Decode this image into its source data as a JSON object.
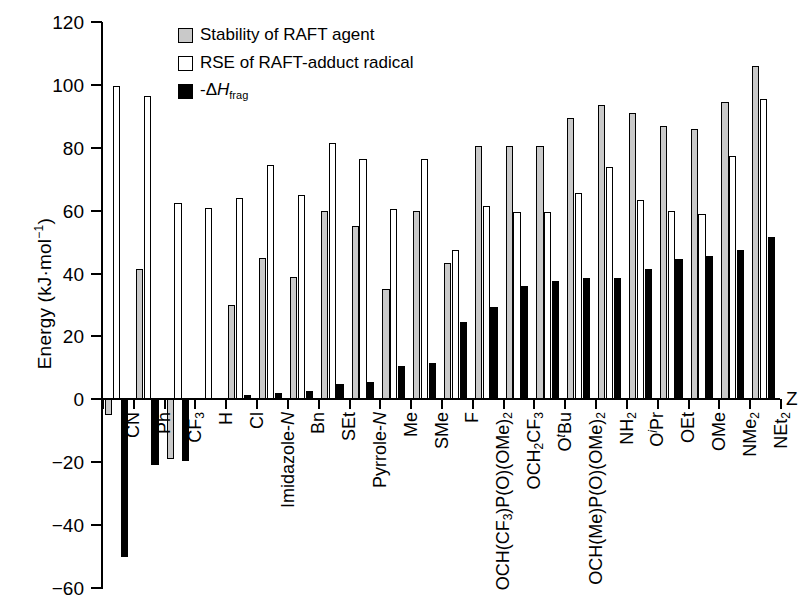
{
  "chart_data": {
    "type": "bar",
    "title": "",
    "xlabel": "Z",
    "ylabel": "Energy (kJ·mol⁻¹)",
    "ylim": [
      -60,
      120
    ],
    "yticks": [
      120,
      100,
      80,
      60,
      40,
      20,
      0,
      -20,
      -40,
      -60
    ],
    "grid": false,
    "legend_position": "top-left-inside",
    "categories": [
      "CN",
      "Ph",
      "CF3",
      "H",
      "Cl",
      "Imidazole-N",
      "Bn",
      "SEt",
      "Pyrrole-N",
      "Me",
      "SMe",
      "F",
      "OCH(CF3)P(O)(OMe)2",
      "OCH2CF3",
      "OtBu",
      "OCH(Me)P(O)(OMe)2",
      "NH2",
      "OiPr",
      "OEt",
      "OMe",
      "NMe2",
      "NEt2"
    ],
    "category_labels_html": [
      "CN",
      "Ph",
      "CF<sub>3</sub>",
      "H",
      "Cl",
      "Imidazole-<i>N</i>",
      "Bn",
      "SEt",
      "Pyrrole-<i>N</i>",
      "Me",
      "SMe",
      "F",
      "OCH(CF<sub>3</sub>)P(O)(OMe)<sub>2</sub>",
      "OCH<sub>2</sub>CF<sub>3</sub>",
      "O<sup>t</sup>Bu",
      "OCH(Me)P(O)(OMe)<sub>2</sub>",
      "NH<sub>2</sub>",
      "O<sup>i</sup>Pr",
      "OEt",
      "OMe",
      "NMe<sub>2</sub>",
      "NEt<sub>2</sub>"
    ],
    "series": [
      {
        "name": "Stability of RAFT agent",
        "color": "#c9c9c9",
        "values": [
          -5,
          41.5,
          -19,
          null,
          30,
          45,
          39,
          60,
          55,
          35,
          60,
          43.5,
          80.5,
          80.5,
          80.5,
          89.5,
          93.5,
          91,
          87,
          86,
          94.5,
          106
        ]
      },
      {
        "name": "RSE of RAFT-adduct radical",
        "color": "#ffffff",
        "values": [
          99.5,
          96.5,
          62.5,
          61,
          64,
          74.5,
          65,
          81.5,
          76.5,
          60.5,
          76.5,
          47.5,
          61.5,
          59.5,
          59.5,
          65.5,
          74,
          63.5,
          60,
          59,
          77.5,
          95.5
        ]
      },
      {
        "name": "-ΔHfrag",
        "color": "#000000",
        "values": [
          -50,
          -21,
          -19.5,
          null,
          1.5,
          2,
          2.5,
          5,
          5.5,
          10.5,
          11.5,
          24.5,
          29.5,
          36,
          37.5,
          38.5,
          38.5,
          41.5,
          44.5,
          45.5,
          47.5,
          51.5
        ]
      }
    ]
  },
  "legend": {
    "items": [
      {
        "swatch": "gray",
        "label": "Stability of RAFT agent"
      },
      {
        "swatch": "white",
        "label": "RSE of RAFT-adduct radical"
      },
      {
        "swatch": "black",
        "label": "-ΔHfrag",
        "html": "-&Delta;<i>H</i><sub>frag</sub>"
      }
    ]
  },
  "axes": {
    "y_title_html": "Energy (kJ·mol<sup>&minus;1</sup>)",
    "x_title": "Z",
    "ytick_labels": [
      "120",
      "100",
      "80",
      "60",
      "40",
      "20",
      "0",
      "−20",
      "−40",
      "−60"
    ]
  }
}
